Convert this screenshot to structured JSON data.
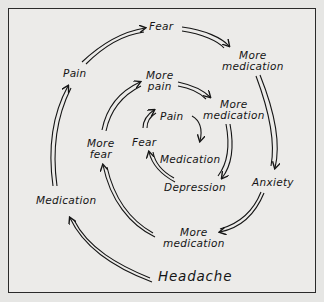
{
  "diagram": {
    "title": "",
    "nodes": {
      "headache": "Headache",
      "medication_outer": "Medication",
      "pain_outer": "Pain",
      "fear_outer": "Fear",
      "more_medication_top": [
        "More",
        "medication"
      ],
      "anxiety": "Anxiety",
      "more_medication_bottom": [
        "More",
        "medication"
      ],
      "more_fear": [
        "More",
        "fear"
      ],
      "more_pain": [
        "More",
        "pain"
      ],
      "more_medication_mid": [
        "More",
        "medication"
      ],
      "depression": "Depression",
      "fear_inner": "Fear",
      "pain_inner": "Pain",
      "medication_inner": "Medication"
    },
    "edges": [
      [
        "Headache",
        "Medication"
      ],
      [
        "Medication",
        "Pain"
      ],
      [
        "Pain",
        "Fear"
      ],
      [
        "Fear",
        "More medication"
      ],
      [
        "More medication",
        "Anxiety"
      ],
      [
        "Anxiety",
        "More medication"
      ],
      [
        "More medication",
        "More fear"
      ],
      [
        "More fear",
        "More pain"
      ],
      [
        "More pain",
        "More medication"
      ],
      [
        "More medication",
        "Depression"
      ],
      [
        "Depression",
        "Fear"
      ],
      [
        "Fear",
        "Pain"
      ],
      [
        "Pain",
        "Medication"
      ]
    ],
    "colors": {
      "ink": "#151515",
      "paper": "#ecebe9",
      "border": "#2a2a2a"
    }
  }
}
